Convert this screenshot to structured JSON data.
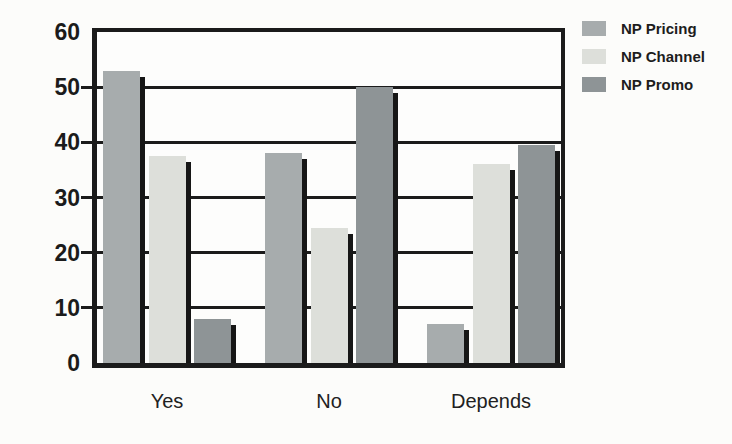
{
  "chart_data": {
    "type": "bar",
    "title": "",
    "xlabel": "",
    "ylabel": "",
    "categories": [
      "Yes",
      "No",
      "Depends"
    ],
    "series": [
      {
        "name": "NP Pricing",
        "color": "#a7acad",
        "values": [
          53,
          38,
          7
        ]
      },
      {
        "name": "NP Channel",
        "color": "#dddfda",
        "values": [
          37.5,
          24.5,
          36
        ]
      },
      {
        "name": "NP Promo",
        "color": "#8e9496",
        "values": [
          8,
          50,
          39.5
        ]
      }
    ],
    "ylim": [
      0,
      60
    ],
    "yticks": [
      0,
      10,
      20,
      30,
      40,
      50,
      60
    ],
    "grid": true,
    "legend_position": "top-right",
    "axis_color": "#1b1b1b",
    "bar_shadow_color": "#161616"
  }
}
